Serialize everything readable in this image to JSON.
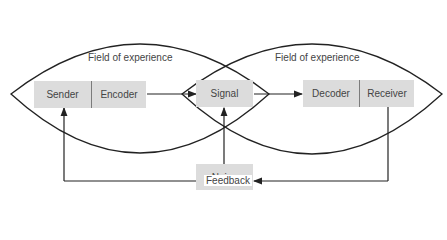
{
  "diagram": {
    "type": "communication-model",
    "fields": [
      {
        "label": "Field of experience",
        "side": "sender"
      },
      {
        "label": "Field of experience",
        "side": "receiver"
      }
    ],
    "nodes": {
      "sender": "Sender",
      "encoder": "Encoder",
      "signal": "Signal",
      "decoder": "Decoder",
      "receiver": "Receiver",
      "noise": "Noise"
    },
    "feedback_label": "Feedback",
    "colors": {
      "box_fill": "#dcdcdc",
      "line": "#222222",
      "text": "#444444"
    }
  }
}
